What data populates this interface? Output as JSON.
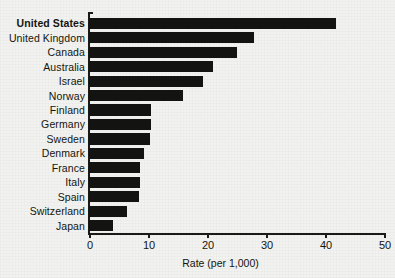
{
  "chart_data": {
    "type": "bar",
    "orientation": "horizontal",
    "title": "",
    "xlabel": "Rate (per 1,000)",
    "ylabel": "",
    "xlim": [
      0,
      50
    ],
    "xticks": [
      0,
      10,
      20,
      30,
      40,
      50
    ],
    "grid": false,
    "legend": null,
    "highlight_category": "United States",
    "bar_color": "#131311",
    "background_color": "#f2f2f0",
    "categories": [
      "United States",
      "United Kingdom",
      "Canada",
      "Australia",
      "Israel",
      "Norway",
      "Finland",
      "Germany",
      "Sweden",
      "Denmark",
      "France",
      "Italy",
      "Spain",
      "Switzerland",
      "Japan"
    ],
    "values": [
      41.8,
      28.0,
      25.0,
      21.0,
      19.3,
      16.0,
      10.5,
      10.5,
      10.3,
      9.3,
      8.6,
      8.6,
      8.5,
      6.5,
      4.0
    ]
  }
}
